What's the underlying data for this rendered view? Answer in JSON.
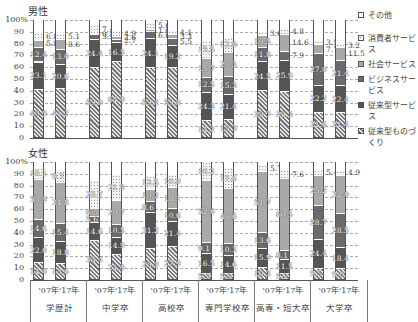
{
  "chart_data": [
    {
      "type": "bar",
      "stacked": true,
      "title": "男性",
      "ylabel": "%",
      "ylim": [
        0,
        100
      ],
      "yticks": [
        0,
        10,
        20,
        30,
        40,
        50,
        60,
        70,
        80,
        90,
        100
      ],
      "grid": true,
      "legend_position": "right",
      "categories": [
        "学歴計 '07",
        "学歴計 '17",
        "中学卒 '07",
        "中学卒 '17",
        "高校卒 '07",
        "高校卒 '17",
        "専門学校卒 '07",
        "専門学校卒 '17",
        "高専・短大卒 '07",
        "高専・短大卒 '17",
        "大学卒 '07",
        "大学卒 '17"
      ],
      "series": [
        {
          "name": "従来型ものづくり",
          "values": [
            40.9,
            41.2,
            59.0,
            64.0,
            59.4,
            59.0,
            14.2,
            15.3,
            39.7,
            39.3,
            21.6,
            21.4
          ]
        },
        {
          "name": "従来型サービス",
          "values": [
            23.1,
            20.6,
            24.4,
            16.5,
            24.1,
            19.2,
            24.3,
            21.4,
            24.5,
            25.9,
            22.2,
            22.4
          ]
        },
        {
          "name": "ビジネスサービス",
          "values": [
            12.4,
            13.0,
            3.9,
            2.7,
            6.6,
            5.5,
            12.5,
            15.3,
            11.8,
            7.9,
            27.0,
            21.4
          ]
        },
        {
          "name": "社会サービス",
          "values": [
            5.8,
            8.6,
            0.7,
            2.6,
            1.6,
            3.3,
            15.7,
            20.3,
            10.5,
            14.6,
            7.7,
            11.5
          ]
        },
        {
          "name": "消費者サービス",
          "values": [
            6.8,
            5.1,
            7.4,
            4.9,
            5.6,
            4.1,
            15.5,
            12.8,
            3.6,
            4.8,
            3.5,
            3.2
          ]
        },
        {
          "name": "その他",
          "values": [
            11.0,
            11.5,
            4.6,
            9.3,
            2.7,
            8.9,
            17.8,
            15.0,
            9.9,
            7.5,
            18.0,
            20.1
          ]
        }
      ]
    },
    {
      "type": "bar",
      "stacked": true,
      "title": "女性",
      "ylabel": "%",
      "ylim": [
        0,
        100
      ],
      "yticks": [
        0,
        10,
        20,
        30,
        40,
        50,
        60,
        70,
        80,
        90,
        100
      ],
      "grid": true,
      "legend_position": "right",
      "categories": [
        "学歴計 '07",
        "学歴計 '17",
        "中学卒 '07",
        "中学卒 '17",
        "高校卒 '07",
        "高校卒 '17",
        "専門学校卒 '07",
        "専門学校卒 '17",
        "高専・短大卒 '07",
        "高専・短大卒 '17",
        "大学卒 '07",
        "大学卒 '17"
      ],
      "series": [
        {
          "name": "従来型ものづくり",
          "values": [
            14.0,
            13.6,
            33.4,
            21.0,
            25.9,
            27.9,
            5.5,
            5.5,
            10.3,
            5.2,
            9.5,
            9.0
          ]
        },
        {
          "name": "従来型サービス",
          "values": [
            22.0,
            18.8,
            14.6,
            14.9,
            31.2,
            21.4,
            16.5,
            14.6,
            15.9,
            11.5,
            24.4,
            18.4
          ]
        },
        {
          "name": "ビジネスサービス",
          "values": [
            14.6,
            15.4,
            5.6,
            10.5,
            8.6,
            10.6,
            9.1,
            10.3,
            13.6,
            8.1,
            28.7,
            28.5
          ]
        },
        {
          "name": "社会サービス",
          "values": [
            33.9,
            34.8,
            6.5,
            20.7,
            10.2,
            18.1,
            52.6,
            46.6,
            51.7,
            60.5,
            25.2,
            32.0
          ]
        },
        {
          "name": "消費者サービス",
          "values": [
            10.1,
            9.7,
            23.7,
            21.9,
            12.5,
            10.9,
            16.2,
            17.6,
            5.7,
            7.6,
            5.4,
            4.9
          ]
        },
        {
          "name": "その他",
          "values": [
            5.4,
            7.7,
            16.2,
            11.0,
            11.6,
            11.1,
            0.1,
            5.4,
            2.8,
            7.1,
            6.8,
            7.2
          ]
        }
      ]
    }
  ],
  "panels": {
    "male": {
      "title": "男性"
    },
    "female": {
      "title": "女性"
    }
  },
  "yaxis": {
    "ticks": [
      "0",
      "10",
      "20",
      "30",
      "40",
      "50",
      "60",
      "70",
      "80",
      "90",
      "100%"
    ]
  },
  "legend": {
    "items": [
      {
        "label": "その他",
        "key": "other"
      },
      {
        "label": "消費者サービス",
        "key": "cons"
      },
      {
        "label": "社会サービス",
        "key": "soc"
      },
      {
        "label": "ビジネスサービス",
        "key": "biz"
      },
      {
        "label": "従来型サービス",
        "key": "trad"
      },
      {
        "label": "従来型ものづくり",
        "key": "manu"
      }
    ]
  },
  "xaxis": {
    "years_label": "'07年'17年",
    "groups": [
      "学歴計",
      "中学卒",
      "高校卒",
      "専門学校卒",
      "高専・短大卒",
      "大学卒"
    ]
  },
  "labels": {
    "male": [
      [
        {
          "v": "40.9",
          "s": 0
        },
        {
          "v": "23.1",
          "s": 1
        },
        {
          "v": "12.4",
          "s": 2
        },
        {
          "v": "5.8",
          "s": 3,
          "out": true
        },
        {
          "v": "6.8",
          "s": 4,
          "out": true
        }
      ],
      [
        {
          "v": "41.2",
          "s": 0
        },
        {
          "v": "20.6",
          "s": 1
        },
        {
          "v": "13.0",
          "s": 2
        },
        {
          "v": "8.6",
          "s": 3,
          "out": true
        },
        {
          "v": "5.1",
          "s": 4,
          "out": true
        }
      ],
      [
        {
          "v": "59.0",
          "s": 0
        },
        {
          "v": "24.4",
          "s": 1
        },
        {
          "v": "3.9",
          "s": 2,
          "out": true
        },
        {
          "v": "0.7",
          "s": 3,
          "out": true
        },
        {
          "v": "7.4",
          "s": 4,
          "out": true
        }
      ],
      [
        {
          "v": "64.0",
          "s": 0
        },
        {
          "v": "16.5",
          "s": 1
        },
        {
          "v": "2.7",
          "s": 2,
          "out": true
        },
        {
          "v": "2.6",
          "s": 3,
          "out": true
        },
        {
          "v": "4.9",
          "s": 4,
          "out": true
        }
      ],
      [
        {
          "v": "59.4",
          "s": 0
        },
        {
          "v": "24.1",
          "s": 1
        },
        {
          "v": "6.6",
          "s": 2,
          "out": true
        },
        {
          "v": "1.6",
          "s": 3,
          "out": true
        },
        {
          "v": "5.6",
          "s": 4,
          "out": true
        }
      ],
      [
        {
          "v": "59.0",
          "s": 0
        },
        {
          "v": "19.2",
          "s": 1
        },
        {
          "v": "5.5",
          "s": 2,
          "out": true
        },
        {
          "v": "3.3",
          "s": 3,
          "out": true
        },
        {
          "v": "4.1",
          "s": 4,
          "out": true
        }
      ],
      [
        {
          "v": "14.2",
          "s": 0
        },
        {
          "v": "24.3",
          "s": 1
        },
        {
          "v": "12.5",
          "s": 2
        },
        {
          "v": "15.7",
          "s": 3
        },
        {
          "v": "15.5",
          "s": 4
        }
      ],
      [
        {
          "v": "15.3",
          "s": 0
        },
        {
          "v": "21.4",
          "s": 1
        },
        {
          "v": "15.3",
          "s": 2
        },
        {
          "v": "20.3",
          "s": 3
        },
        {
          "v": "12.8",
          "s": 4
        }
      ],
      [
        {
          "v": "39.7",
          "s": 0
        },
        {
          "v": "24.5",
          "s": 1
        },
        {
          "v": "11.8",
          "s": 2
        },
        {
          "v": "10.5",
          "s": 3
        },
        {
          "v": "3.6",
          "s": 4,
          "out": true
        }
      ],
      [
        {
          "v": "39.3",
          "s": 0
        },
        {
          "v": "25.9",
          "s": 1
        },
        {
          "v": "7.9",
          "s": 2,
          "out": true
        },
        {
          "v": "14.6",
          "s": 3,
          "out": true
        },
        {
          "v": "4.8",
          "s": 4,
          "out": true
        }
      ],
      [
        {
          "v": "21.6",
          "s": 0
        },
        {
          "v": "22.2",
          "s": 1
        },
        {
          "v": "27.0",
          "s": 2
        },
        {
          "v": "7.7",
          "s": 3,
          "out": true
        },
        {
          "v": "3.5",
          "s": 4,
          "out": true
        }
      ],
      [
        {
          "v": "21.4",
          "s": 0
        },
        {
          "v": "22.4",
          "s": 1
        },
        {
          "v": "21.4",
          "s": 2
        },
        {
          "v": "11.5",
          "s": 3,
          "out": true
        },
        {
          "v": "3.2",
          "s": 4,
          "out": true
        }
      ]
    ],
    "female": [
      [
        {
          "v": "14.0",
          "s": 0
        },
        {
          "v": "22.0",
          "s": 1
        },
        {
          "v": "14.6",
          "s": 2
        },
        {
          "v": "33.9",
          "s": 3
        },
        {
          "v": "10.1",
          "s": 4
        }
      ],
      [
        {
          "v": "13.6",
          "s": 0
        },
        {
          "v": "18.8",
          "s": 1
        },
        {
          "v": "15.4",
          "s": 2
        },
        {
          "v": "34.8",
          "s": 3
        },
        {
          "v": "9.7",
          "s": 4
        }
      ],
      [
        {
          "v": "33.4",
          "s": 0
        },
        {
          "v": "14.6",
          "s": 1
        },
        {
          "v": "5.6",
          "s": 2
        },
        {
          "v": "6.5",
          "s": 3
        },
        {
          "v": "23.7",
          "s": 4
        }
      ],
      [
        {
          "v": "21.0",
          "s": 0
        },
        {
          "v": "14.9",
          "s": 1
        },
        {
          "v": "10.5",
          "s": 2
        },
        {
          "v": "20.7",
          "s": 3
        },
        {
          "v": "21.9",
          "s": 4
        }
      ],
      [
        {
          "v": "25.9",
          "s": 0
        },
        {
          "v": "31.2",
          "s": 1
        },
        {
          "v": "8.6",
          "s": 2
        },
        {
          "v": "10.2",
          "s": 3
        },
        {
          "v": "12.5",
          "s": 4
        }
      ],
      [
        {
          "v": "27.9",
          "s": 0
        },
        {
          "v": "21.4",
          "s": 1
        },
        {
          "v": "10.6",
          "s": 2
        },
        {
          "v": "18.1",
          "s": 3
        },
        {
          "v": "10.9",
          "s": 4
        }
      ],
      [
        {
          "v": "5.5",
          "s": 0
        },
        {
          "v": "16.5",
          "s": 1
        },
        {
          "v": "9.1",
          "s": 2
        },
        {
          "v": "52.6",
          "s": 3
        },
        {
          "v": "16.2",
          "s": 4
        }
      ],
      [
        {
          "v": "5.5",
          "s": 0
        },
        {
          "v": "14.6",
          "s": 1
        },
        {
          "v": "10.3",
          "s": 2
        },
        {
          "v": "46.6",
          "s": 3
        },
        {
          "v": "17.6",
          "s": 4
        }
      ],
      [
        {
          "v": "10.3",
          "s": 0
        },
        {
          "v": "15.9",
          "s": 1
        },
        {
          "v": "13.6",
          "s": 2
        },
        {
          "v": "51.7",
          "s": 3
        },
        {
          "v": "5.7",
          "s": 4,
          "out": true
        }
      ],
      [
        {
          "v": "5.2",
          "s": 0
        },
        {
          "v": "11.5",
          "s": 1
        },
        {
          "v": "8.1",
          "s": 2
        },
        {
          "v": "60.5",
          "s": 3
        },
        {
          "v": "7.6",
          "s": 4,
          "out": true
        }
      ],
      [
        {
          "v": "9.5",
          "s": 0
        },
        {
          "v": "24.4",
          "s": 1
        },
        {
          "v": "28.7",
          "s": 2
        },
        {
          "v": "25.2",
          "s": 3
        },
        {
          "v": "5.4",
          "s": 4,
          "out": true
        }
      ],
      [
        {
          "v": "9.0",
          "s": 0
        },
        {
          "v": "18.4",
          "s": 1
        },
        {
          "v": "28.5",
          "s": 2
        },
        {
          "v": "32.0",
          "s": 3
        },
        {
          "v": "4.9",
          "s": 4,
          "out": true
        }
      ]
    ]
  }
}
